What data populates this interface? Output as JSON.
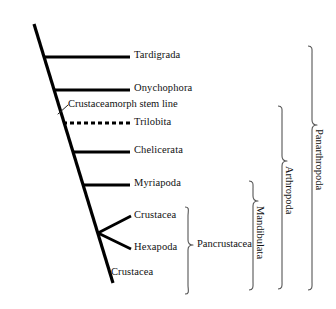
{
  "figure": {
    "type": "cladogram",
    "background_color": "#ffffff",
    "line_color": "#000000",
    "bracket_color": "#555555"
  },
  "taxa": [
    {
      "id": "tardigrada",
      "label": "Tardigrada",
      "branch_style": "solid",
      "label_x": 134,
      "label_y": 50,
      "branch_x1": 43,
      "branch_y1": 57,
      "branch_x2": 130,
      "branch_y2": 57
    },
    {
      "id": "onychophora",
      "label": "Onychophora",
      "branch_style": "solid",
      "label_x": 134,
      "label_y": 83,
      "branch_x1": 53,
      "branch_y1": 90,
      "branch_x2": 130,
      "branch_y2": 90
    },
    {
      "id": "trilobita",
      "label": "Trilobita",
      "branch_style": "dashed",
      "label_x": 134,
      "label_y": 117,
      "branch_x1": 63,
      "branch_y1": 123,
      "branch_x2": 130,
      "branch_y2": 123
    },
    {
      "id": "chelicerata",
      "label": "Chelicerata",
      "branch_style": "solid",
      "label_x": 134,
      "label_y": 145,
      "branch_x1": 72,
      "branch_y1": 152,
      "branch_x2": 130,
      "branch_y2": 152
    },
    {
      "id": "myriapoda",
      "label": "Myriapoda",
      "branch_style": "solid",
      "label_x": 134,
      "label_y": 178,
      "branch_x1": 82,
      "branch_y1": 185,
      "branch_x2": 130,
      "branch_y2": 185
    },
    {
      "id": "crustacea-upper",
      "label": "Crustacea",
      "branch_style": "solid",
      "label_x": 134,
      "label_y": 210,
      "branch_x1": 98,
      "branch_y1": 233,
      "branch_x2": 130,
      "branch_y2": 217
    },
    {
      "id": "hexapoda",
      "label": "Hexapoda",
      "branch_style": "solid",
      "label_x": 134,
      "label_y": 242,
      "branch_x1": 98,
      "branch_y1": 233,
      "branch_x2": 130,
      "branch_y2": 249
    },
    {
      "id": "crustacea-lower",
      "label": "Crustacea",
      "branch_style": "solid",
      "label_x": 111,
      "label_y": 267,
      "branch_x1": 98,
      "branch_y1": 233,
      "branch_x2": 108,
      "branch_y2": 273
    }
  ],
  "annotations": {
    "stem_line": {
      "label": "Crustaceamorph stem line",
      "label_x": 67,
      "label_y": 103,
      "leader_x1": 58,
      "leader_y1": 114,
      "leader_x2": 67,
      "leader_y2": 105
    }
  },
  "trunk": {
    "x1": 34,
    "y1": 24,
    "x2": 113,
    "y2": 283
  },
  "clades": [
    {
      "id": "pancrustacea",
      "label": "Pancrustacea",
      "orientation": "horizontal",
      "brace_x": 188,
      "brace_top": 206,
      "brace_bottom": 294,
      "label_x": 197,
      "label_y": 245
    },
    {
      "id": "mandibulata",
      "label": "Mandibulata",
      "orientation": "vertical",
      "brace_x": 254,
      "brace_top": 180,
      "brace_bottom": 290,
      "label_x": 247,
      "label_y": 200
    },
    {
      "id": "arthropoda",
      "label": "Arthropoda",
      "orientation": "vertical",
      "brace_x": 283,
      "brace_top": 105,
      "brace_bottom": 289,
      "label_x": 276,
      "label_y": 160
    },
    {
      "id": "panarthropoda",
      "label": "Panarthropoda",
      "orientation": "vertical",
      "brace_x": 313,
      "brace_top": 45,
      "brace_bottom": 290,
      "label_x": 306,
      "label_y": 125
    }
  ]
}
